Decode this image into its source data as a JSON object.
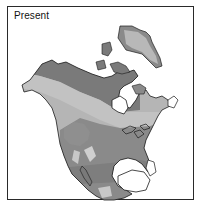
{
  "map": {
    "title": "Present",
    "region": "North America",
    "zones": [
      {
        "name": "zone-dark",
        "color": "#7a7a7a"
      },
      {
        "name": "zone-medium",
        "color": "#8f8f8f"
      },
      {
        "name": "zone-light",
        "color": "#b5b5b5"
      },
      {
        "name": "zone-pale",
        "color": "#cfcfcf"
      }
    ],
    "colors": {
      "outline": "#1a1a1a",
      "background": "#ffffff",
      "frame": "#2a2a2a"
    }
  }
}
